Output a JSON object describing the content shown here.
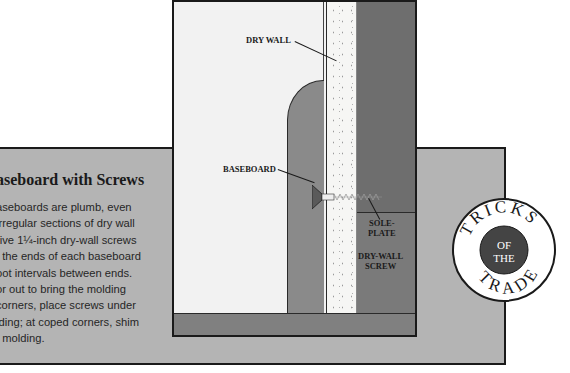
{
  "panel": {
    "title": "aseboard with Screws",
    "body_lines": [
      "aseboards are plumb, even",
      "irregular sections of dry wall",
      "rive 1¼-inch dry-wall screws",
      "t the ends of each baseboard",
      "oot intervals between ends.",
      "or out to bring the molding",
      "corners, place screws under",
      "lding; at coped corners, shim",
      "t molding."
    ]
  },
  "illustration": {
    "labels": {
      "dry_wall": "DRY WALL",
      "baseboard": "BASEBOARD",
      "sole_plate_1": "SOLE-",
      "sole_plate_2": "PLATE",
      "screw_1": "DRY-WALL",
      "screw_2": "SCREW"
    }
  },
  "badge": {
    "top": "TRICKS",
    "center_1": "OF",
    "center_2": "THE",
    "bottom": "TRADE"
  },
  "colors": {
    "panel_gray": "#b4b4b4",
    "stud_gray": "#6e6e6e",
    "badge_center": "#444444"
  }
}
